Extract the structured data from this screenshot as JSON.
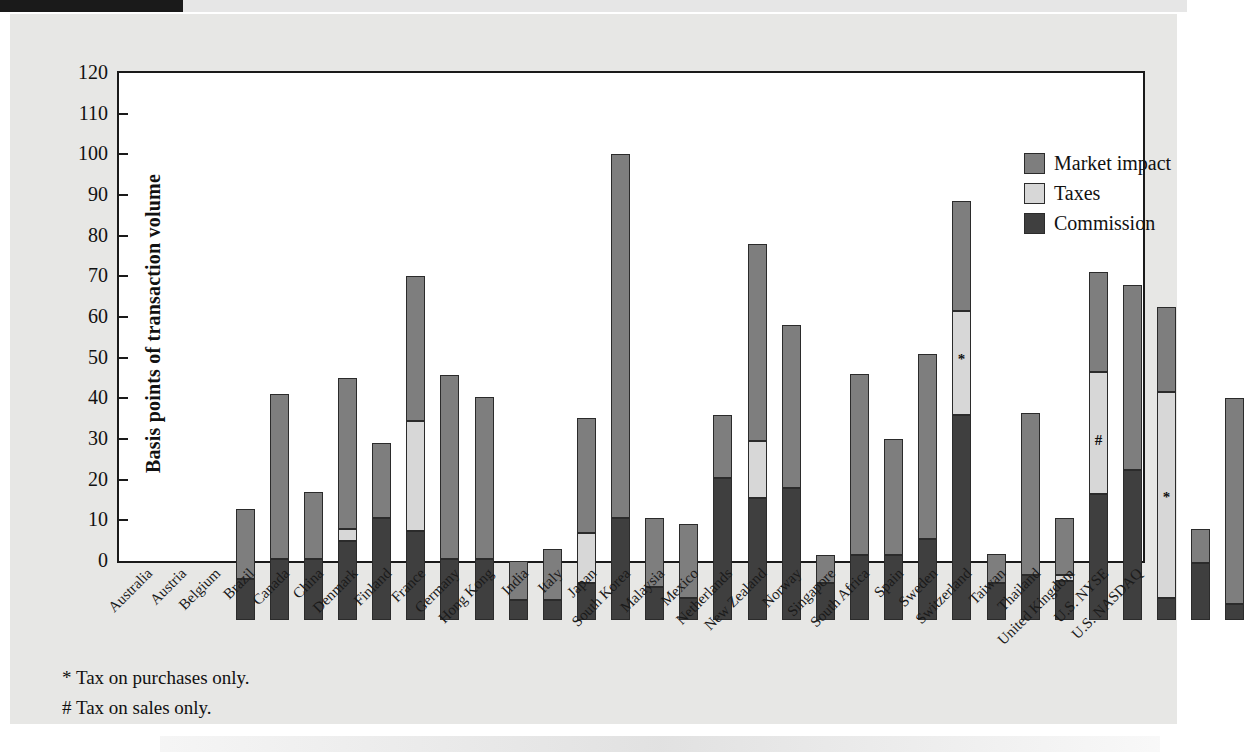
{
  "figure": {
    "y_axis_title": "Basis points of transaction volume",
    "y_ticks": [
      "120",
      "110",
      "100",
      "90",
      "80",
      "70",
      "60",
      "50",
      "40",
      "30",
      "20",
      "10",
      "0"
    ],
    "footnotes": [
      "* Tax on purchases only.",
      "# Tax on sales only."
    ],
    "legend": [
      {
        "label": "Market impact",
        "color": "#7e7e7e",
        "swatch_name": "legend-swatch-market-impact"
      },
      {
        "label": "Taxes",
        "color": "#d7d7d7",
        "swatch_name": "legend-swatch-taxes"
      },
      {
        "label": "Commission",
        "color": "#3f3f3f",
        "swatch_name": "legend-swatch-commission"
      }
    ]
  },
  "chart_data": {
    "type": "bar",
    "subtype": "stacked-bar",
    "title": "",
    "xlabel": "",
    "ylabel": "Basis points of transaction volume",
    "ylim": [
      0,
      120
    ],
    "ytick_step": 10,
    "grid": false,
    "legend_position": "top-right",
    "stack_order": [
      "Commission",
      "Taxes",
      "Market impact"
    ],
    "categories": [
      "Australia",
      "Austria",
      "Belgium",
      "Brazil",
      "Canada",
      "China",
      "Denmark",
      "Finland",
      "France",
      "Germany",
      "Hong Kong",
      "India",
      "Italy",
      "Japan",
      "South Korea",
      "Malaysia",
      "Mexico",
      "Netherlands",
      "New Zealand",
      "Norway",
      "Singapore",
      "South Africa",
      "Spain",
      "Sweden",
      "Switzerland",
      "Taiwan",
      "Thailand",
      "United Kingdom",
      "U.S. NYSE",
      "U.S. NASDAQ"
    ],
    "series": [
      {
        "name": "Commission",
        "color": "#3f3f3f",
        "values": [
          10.0,
          15.0,
          15.0,
          19.5,
          25.0,
          22.0,
          15.0,
          15.0,
          5.0,
          5.0,
          9.0,
          25.0,
          8.0,
          5.5,
          35.0,
          30.0,
          32.5,
          9.0,
          16.0,
          16.0,
          20.0,
          50.5,
          9.0,
          11.0,
          9.5,
          31.0,
          37.0,
          5.5,
          14.0,
          4.0
        ]
      },
      {
        "name": "Taxes",
        "color": "#d7d7d7",
        "values": [
          0,
          0,
          0,
          3.0,
          0,
          27.0,
          0,
          0,
          0,
          0,
          12.5,
          0,
          0,
          0,
          0,
          14.0,
          0,
          0,
          0,
          0,
          0,
          25.5,
          0,
          0,
          1.5,
          30.0,
          0,
          50.5,
          0,
          0
        ]
      },
      {
        "name": "Market impact",
        "color": "#7e7e7e",
        "values": [
          17.4,
          40.6,
          16.6,
          37.0,
          18.6,
          35.6,
          45.2,
          39.8,
          9.4,
          12.5,
          28.1,
          89.5,
          17.0,
          18.2,
          15.4,
          48.5,
          40.0,
          7.0,
          44.5,
          28.6,
          45.5,
          27.0,
          7.2,
          39.8,
          14.0,
          24.7,
          45.3,
          21.0,
          8.5,
          50.6
        ]
      }
    ],
    "totals": [
      27.4,
      55.6,
      31.6,
      59.5,
      43.6,
      84.6,
      60.2,
      54.8,
      14.4,
      17.5,
      49.6,
      114.5,
      25.0,
      23.7,
      50.4,
      92.5,
      72.5,
      16.0,
      60.5,
      44.6,
      65.5,
      103.0,
      16.2,
      50.8,
      25.0,
      85.7,
      82.3,
      77.0,
      22.5,
      54.6
    ],
    "annotations": [
      {
        "category": "South Africa",
        "marker": "*",
        "segment": "Taxes",
        "at_value": 64
      },
      {
        "category": "Taiwan",
        "marker": "#",
        "segment": "Taxes",
        "at_value": 44
      },
      {
        "category": "United Kingdom",
        "marker": "*",
        "segment": "Taxes",
        "at_value": 30
      }
    ],
    "notes": [
      "* Tax on purchases only.",
      "# Tax on sales only."
    ]
  }
}
